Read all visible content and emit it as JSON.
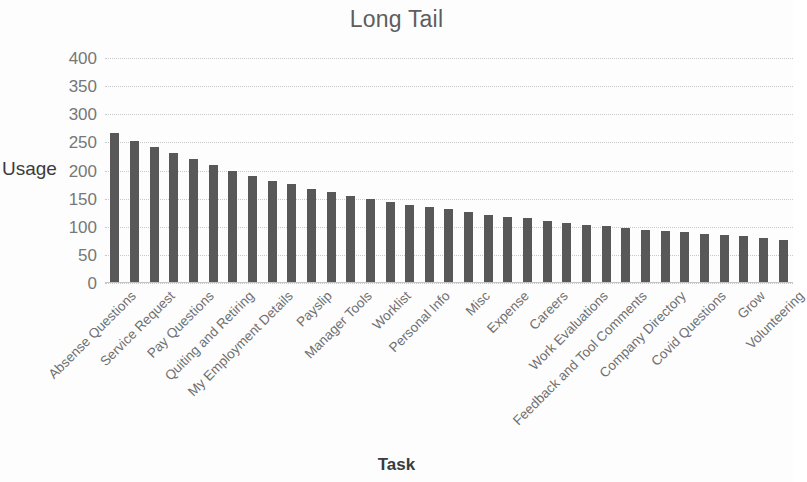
{
  "chart_data": {
    "type": "bar",
    "title": "Long Tail",
    "xlabel": "Task",
    "ylabel": "Usage",
    "ylim": [
      0,
      400
    ],
    "ytick_values": [
      400,
      350,
      300,
      250,
      200,
      150,
      100,
      50,
      0
    ],
    "ytick_labels": [
      "400",
      "350",
      "300",
      "250",
      "200",
      "150",
      "100",
      "50",
      "0"
    ],
    "grid": true,
    "legend": "none",
    "bar_color": "#585858",
    "grid_color": "#c9c9c9",
    "text_color": "#6f6f6f",
    "title_color": "#5e5e5e",
    "categories": [
      "Absense Questions",
      "",
      "Service Request",
      "",
      "Pay Questions",
      "",
      "Quiting and Retiring",
      "",
      "My Employment Details",
      "",
      "Payslip",
      "",
      "Manager Tools",
      "",
      "Worklist",
      "",
      "Personal Info",
      "",
      "Misc",
      "",
      "Expense",
      "",
      "Careers",
      "",
      "Work Evaluations",
      "",
      "Feedback and Tool Comments",
      "",
      "Company Directory",
      "",
      "Covid Questions",
      "",
      "Grow",
      "",
      "Volunteering"
    ],
    "visible_tick_labels": [
      "Absense Questions",
      "Service Request",
      "Pay Questions",
      "Quiting and Retiring",
      "My Employment Details",
      "Payslip",
      "Manager Tools",
      "Worklist",
      "Personal Info",
      "Misc",
      "Expense",
      "Careers",
      "Work Evaluations",
      "Feedback and Tool Comments",
      "Company Directory",
      "Covid Questions",
      "Grow",
      "Volunteering"
    ],
    "values": [
      267,
      253,
      242,
      231,
      221,
      210,
      200,
      191,
      181,
      176,
      168,
      161,
      154,
      150,
      144,
      139,
      135,
      131,
      126,
      121,
      118,
      115,
      111,
      107,
      104,
      101,
      97,
      95,
      93,
      90,
      87,
      85,
      83,
      80,
      76
    ]
  }
}
